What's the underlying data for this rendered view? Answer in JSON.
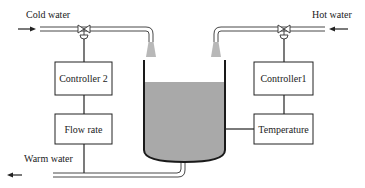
{
  "diagram": {
    "labels": {
      "cold_water": "Cold water",
      "hot_water": "Hot water",
      "warm_water": "Warm water"
    },
    "boxes": {
      "controller2": "Controller 2",
      "controller1": "Controller1",
      "flow_rate": "Flow rate",
      "temperature": "Temperature"
    },
    "colors": {
      "line": "#222222",
      "liquid": "#a9a9a9",
      "spray": "#b8b8b8",
      "background": "#ffffff"
    },
    "nodes": [
      {
        "id": "cold_water_inlet",
        "label": "Cold water"
      },
      {
        "id": "hot_water_inlet",
        "label": "Hot water"
      },
      {
        "id": "valve_cold",
        "label": ""
      },
      {
        "id": "valve_hot",
        "label": ""
      },
      {
        "id": "controller2",
        "label": "Controller 2"
      },
      {
        "id": "controller1",
        "label": "Controller1"
      },
      {
        "id": "flow_rate",
        "label": "Flow rate"
      },
      {
        "id": "temperature",
        "label": "Temperature"
      },
      {
        "id": "tank",
        "label": ""
      },
      {
        "id": "warm_water_outlet",
        "label": "Warm water"
      }
    ],
    "edges": [
      {
        "from": "cold_water_inlet",
        "to": "valve_cold"
      },
      {
        "from": "valve_cold",
        "to": "tank"
      },
      {
        "from": "hot_water_inlet",
        "to": "valve_hot"
      },
      {
        "from": "valve_hot",
        "to": "tank"
      },
      {
        "from": "controller2",
        "to": "valve_cold"
      },
      {
        "from": "flow_rate",
        "to": "controller2"
      },
      {
        "from": "warm_water_outlet",
        "to": "flow_rate"
      },
      {
        "from": "controller1",
        "to": "valve_hot"
      },
      {
        "from": "temperature",
        "to": "controller1"
      },
      {
        "from": "tank",
        "to": "temperature"
      },
      {
        "from": "tank",
        "to": "warm_water_outlet"
      }
    ]
  }
}
